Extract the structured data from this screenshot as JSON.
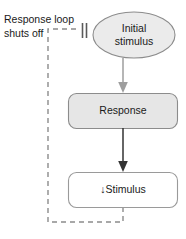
{
  "diagram": {
    "nodes": [
      {
        "id": "initial-stimulus",
        "shape": "ellipse",
        "line1": "Initial",
        "line2": "stimulus",
        "fill": "#ebebeb",
        "stroke": "#8c8c8c"
      },
      {
        "id": "response",
        "shape": "rounded-rect",
        "label": "Response",
        "fill": "#e6e6e6",
        "stroke": "#8c8c8c"
      },
      {
        "id": "stimulus",
        "shape": "rounded-rect",
        "arrow_glyph": "↓",
        "label": "Stimulus",
        "fill": "#ffffff",
        "stroke": "#9a9a9a"
      }
    ],
    "annotations": [
      {
        "id": "response-loop",
        "line1": "Response loop",
        "line2": "shuts off"
      }
    ],
    "connectors": [
      {
        "id": "initial-to-response",
        "style": "solid-arrow",
        "color": "#9e9e9e"
      },
      {
        "id": "response-to-stimulus",
        "style": "solid-arrow",
        "color": "#333333"
      },
      {
        "id": "feedback-loop",
        "style": "dashed",
        "color": "#8c8c8c",
        "terminator": "inhibition-bars"
      }
    ],
    "colors": {
      "background": "#ffffff",
      "text": "#1a1a1a",
      "gray_fill": "#e6e6e6",
      "gray_stroke": "#8c8c8c",
      "dark_arrow": "#333333",
      "light_arrow": "#9e9e9e"
    }
  }
}
